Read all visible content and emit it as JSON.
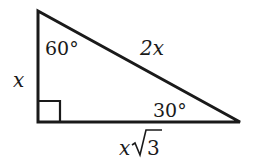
{
  "diagram": {
    "type": "right-triangle-30-60-90",
    "vertices": {
      "top": [
        38,
        11
      ],
      "right_angle": [
        38,
        122
      ],
      "right": [
        240,
        122
      ]
    },
    "angles": {
      "top": "60°",
      "right": "30°",
      "right_angle_marker": true
    },
    "sides": {
      "short_leg": "x",
      "hypotenuse": "2x",
      "long_leg_var": "x",
      "long_leg_radicand": "3"
    },
    "colors": {
      "stroke": "#1a1a1a",
      "background": "#ffffff"
    }
  }
}
